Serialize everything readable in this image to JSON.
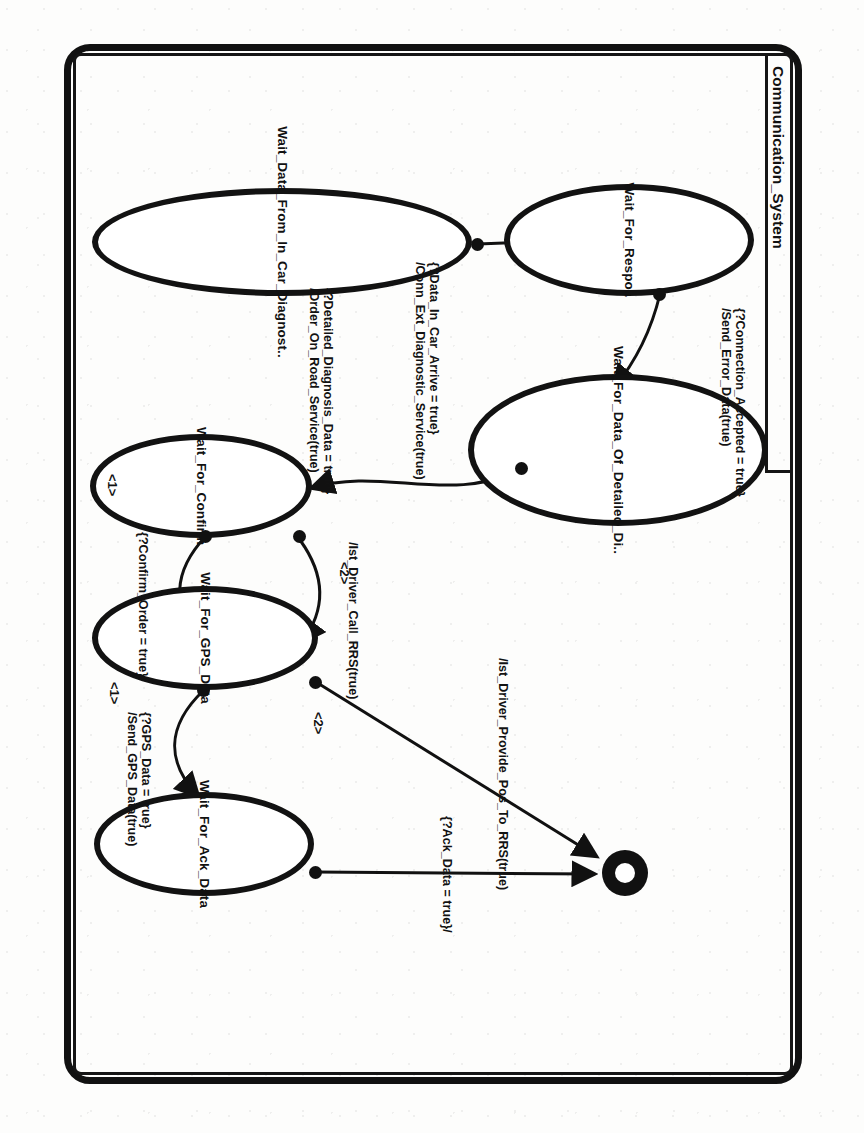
{
  "document": {
    "kind": "scanned-figure",
    "diagram_type": "UML statechart",
    "title": "Communication_System"
  },
  "diagram": {
    "title": "Communication_System",
    "states": [
      {
        "id": "s_wait_resp",
        "label": "Wait_For_Respo.."
      },
      {
        "id": "s_wait_detail",
        "label": "Wait_For_Data_Of_Detailed_Di.."
      },
      {
        "id": "s_wait_incar",
        "label": "Wait_Data_From_In_Car_Diagnost.."
      },
      {
        "id": "s_wait_confirm",
        "label": "Wait_For_Confirm"
      },
      {
        "id": "s_wait_gps",
        "label": "Wait_For_GPS_Data"
      },
      {
        "id": "s_wait_ack",
        "label": "Wait_For_Ack_Data"
      }
    ],
    "final_state": {
      "id": "s_final",
      "label": ""
    },
    "transitions": [
      {
        "id": "t1",
        "from": "s_wait_incar",
        "to": "s_wait_resp",
        "guard": "{?Data_In_Car_Arrive = true}",
        "action": "/Conn_Ext_Diagnostic_Service(true)",
        "order": ""
      },
      {
        "id": "t2",
        "from": "s_wait_resp",
        "to": "s_wait_detail",
        "guard": "{?Connection_Accepted = true}",
        "action": "/Send_Error_Data(true)",
        "order": ""
      },
      {
        "id": "t3",
        "from": "s_wait_detail",
        "to": "s_wait_confirm",
        "guard": "{?Detailed_Diagnosis_Data = true}",
        "action": "/Order_On_Road_Service(true)",
        "order": ""
      },
      {
        "id": "t4",
        "from": "s_wait_confirm",
        "to": "s_wait_gps",
        "guard": "{?Confirm_Order = true}/",
        "action": "",
        "order": "<1>"
      },
      {
        "id": "t5",
        "from": "s_wait_confirm",
        "to": "s_wait_gps",
        "guard": "",
        "action": "/Ist_Driver_Call_RRS(true)",
        "order": "<2>"
      },
      {
        "id": "t6",
        "from": "s_wait_gps",
        "to": "s_wait_ack",
        "guard": "{?GPS_Data = true}",
        "action": "/Send_GPS_Data(true)",
        "order": "<1>"
      },
      {
        "id": "t7",
        "from": "s_wait_gps",
        "to": "s_final",
        "guard": "",
        "action": "/Ist_Driver_Provide_Pos_To_RRS(true)",
        "order": "<2>"
      },
      {
        "id": "t8",
        "from": "s_wait_ack",
        "to": "s_final",
        "guard": "{?Ack_Data = true}/",
        "action": "",
        "order": ""
      }
    ],
    "order_markers": [
      "<1>",
      "<2>"
    ],
    "colors": {
      "ink": "#111111",
      "paper": "#fdfdfc"
    }
  }
}
